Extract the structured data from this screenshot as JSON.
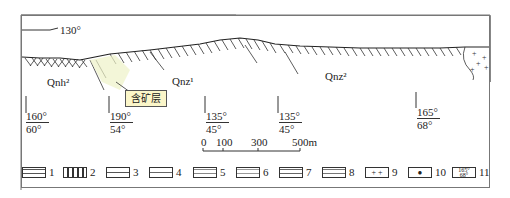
{
  "figure": {
    "top_strike_label": "130°",
    "units": [
      {
        "id": "qnh2",
        "label": "Qnh²"
      },
      {
        "id": "qnz1",
        "label": "Qnz¹"
      },
      {
        "id": "qnz2",
        "label": "Qnz²"
      }
    ],
    "callout": "含矿层",
    "attitudes": [
      {
        "strike": "160°",
        "dip": "60°"
      },
      {
        "strike": "190°",
        "dip": "54°"
      },
      {
        "strike": "135°",
        "dip": "45°"
      },
      {
        "strike": "135°",
        "dip": "45°"
      },
      {
        "strike": "165°",
        "dip": "68°"
      }
    ],
    "scale_bar": {
      "ticks": [
        "0",
        "100",
        "300",
        "500m"
      ]
    },
    "legend": [
      "1",
      "2",
      "3",
      "4",
      "5",
      "6",
      "7",
      "8",
      "9",
      "10",
      "11"
    ]
  }
}
